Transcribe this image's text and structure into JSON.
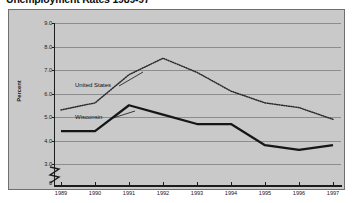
{
  "figure": {
    "title": "Unemployment Rates 1989-97",
    "frame_border_color": "#6f6f6f",
    "plot_background": "#c9c9c9",
    "gridline_color": "#8d8d8d",
    "axis_color": "#1c1c1c"
  },
  "axis": {
    "y_title": "Percent",
    "y_ticks": [
      "9.0",
      "8.0",
      "7.0",
      "6.0",
      "5.0",
      "4.0",
      "3.0"
    ],
    "y_zero_tick": "0",
    "x_ticks": [
      "1989",
      "1990",
      "1991",
      "1992",
      "1993",
      "1994",
      "1995",
      "1996",
      "1997"
    ]
  },
  "series_labels": {
    "united_states": "United States",
    "wisconsin": "Wisconsin"
  },
  "chart_data": {
    "type": "line",
    "title": "Unemployment Rates 1989-97",
    "xlabel": "",
    "ylabel": "Percent",
    "x": [
      "1989",
      "1990",
      "1991",
      "1992",
      "1993",
      "1994",
      "1995",
      "1996",
      "1997"
    ],
    "ylim": [
      3.0,
      9.0
    ],
    "y_axis_break": true,
    "y_ticks": [
      3.0,
      4.0,
      5.0,
      6.0,
      7.0,
      8.0,
      9.0
    ],
    "grid": true,
    "legend": "in-plot labels",
    "series": [
      {
        "name": "United States",
        "style": "dotted",
        "color": "#2b2b2b",
        "values": [
          5.3,
          5.6,
          6.8,
          7.5,
          6.9,
          6.1,
          5.6,
          5.4,
          4.9
        ]
      },
      {
        "name": "Wisconsin",
        "style": "solid",
        "color": "#161616",
        "values": [
          4.4,
          4.4,
          5.5,
          5.1,
          4.7,
          4.7,
          3.8,
          3.6,
          3.8
        ]
      }
    ]
  }
}
